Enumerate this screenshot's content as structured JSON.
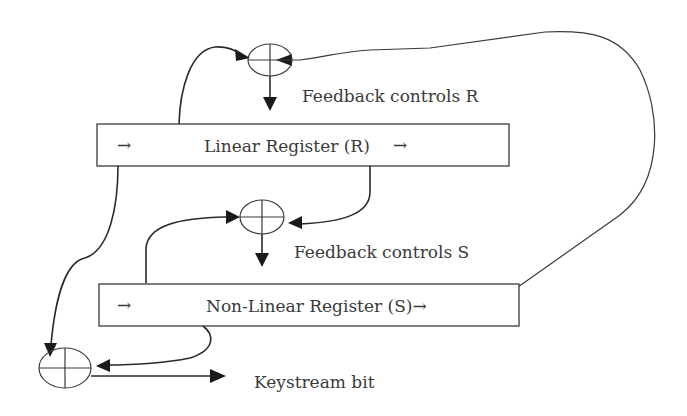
{
  "diagram": {
    "type": "stream-cipher-block-diagram",
    "registers": [
      {
        "id": "linear",
        "label": "Linear Register (R)",
        "left_arrow": "→",
        "right_arrow": "→"
      },
      {
        "id": "nonlinear",
        "label": "Non-Linear Register (S)→",
        "left_arrow": "→"
      }
    ],
    "xor_nodes": [
      {
        "id": "xor-r",
        "symbol": "⊕"
      },
      {
        "id": "xor-s",
        "symbol": "⊕"
      },
      {
        "id": "xor-out",
        "symbol": "⊕"
      }
    ],
    "labels": {
      "feedback_r": "Feedback controls R",
      "feedback_s": "Feedback controls S",
      "keystream": "Keystream bit"
    },
    "colors": {
      "line": "#2a2a2a",
      "text": "#3a3a3a",
      "background": "#ffffff"
    }
  }
}
